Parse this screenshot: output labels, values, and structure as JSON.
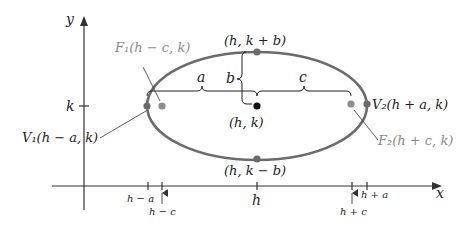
{
  "figure": {
    "type": "ellipse-diagram",
    "colors": {
      "axis": "#333333",
      "ellipse": "#6b6b6b",
      "vertex_point": "#6b6b6b",
      "focus_point": "#8c8c8c",
      "center_point": "#111111",
      "label_gray": "#8a8a8a",
      "label_dark": "#222222"
    },
    "axes": {
      "x_label": "x",
      "y_label": "y",
      "k_tick_label": "k",
      "h_tick_label": "h",
      "x_ticks": [
        {
          "label": "h − a",
          "position": "below"
        },
        {
          "label": "h − c",
          "position": "below-arrow"
        },
        {
          "label": "h",
          "position": "below"
        },
        {
          "label": "h + c",
          "position": "below-arrow"
        },
        {
          "label": "h + a",
          "position": "below"
        }
      ]
    },
    "points": {
      "center": "(h, k)",
      "top_covertex": "(h, k + b)",
      "bottom_covertex": "(h, k − b)",
      "vertex1": "V₁(h − a, k)",
      "vertex2": "V₂(h + a, k)",
      "focus1": "F₁(h − c, k)",
      "focus2": "F₂(h + c, k)"
    },
    "segments": {
      "a": "a",
      "b": "b",
      "c": "c"
    }
  }
}
